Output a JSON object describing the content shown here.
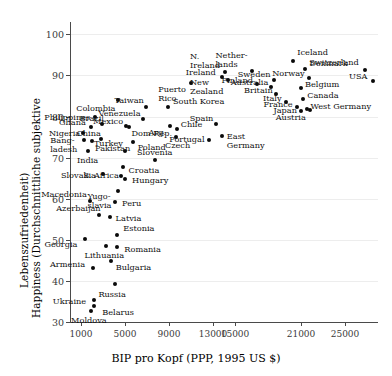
{
  "chart_data": {
    "type": "scatter",
    "title": "",
    "xlabel": "BIP pro Kopf (PPP, 1995 US $)",
    "ylabel_line1": "Happiness (Durchschnittliche subjektive",
    "ylabel_line2": "Lebenszufriedenheit)",
    "xlim": [
      0,
      28000
    ],
    "ylim": [
      30,
      103
    ],
    "grid": "horizontal",
    "legend": "none",
    "xticks": [
      1000,
      5000,
      9000,
      13000,
      15000,
      21000,
      25000
    ],
    "xtick_labels": [
      "1000",
      "5000",
      "9000",
      "13000",
      "15000",
      "21000",
      "25000"
    ],
    "yticks": [
      30,
      40,
      50,
      60,
      70,
      80,
      90,
      100
    ],
    "ytick_labels": [
      "30",
      "40",
      "50",
      "60",
      "70",
      "80",
      "90",
      "100"
    ],
    "points": [
      {
        "name": "Moldova",
        "x": 1900,
        "y": 32.6,
        "lx": -2,
        "ly": 9,
        "a": "c"
      },
      {
        "name": "Ukraine",
        "x": 2200,
        "y": 35.3,
        "lx": -8,
        "ly": 1,
        "a": "r"
      },
      {
        "name": "Belarus",
        "x": 2200,
        "y": 33.9,
        "lx": 8,
        "ly": 6,
        "a": "l"
      },
      {
        "name": "Russia",
        "x": 4100,
        "y": 39.3,
        "lx": -3,
        "ly": 10,
        "a": "c"
      },
      {
        "name": "Armenia",
        "x": 2100,
        "y": 43.1,
        "lx": -8,
        "ly": -4,
        "a": "r"
      },
      {
        "name": "Bulgaria",
        "x": 3700,
        "y": 44.9,
        "lx": 5,
        "ly": 6,
        "a": "l"
      },
      {
        "name": "Lithuania",
        "x": 3300,
        "y": 48.4,
        "lx": -2,
        "ly": 9,
        "a": "c"
      },
      {
        "name": "Georgia",
        "x": 1400,
        "y": 50.2,
        "lx": -8,
        "ly": 5,
        "a": "r"
      },
      {
        "name": "Romania",
        "x": 4300,
        "y": 48.2,
        "lx": 7,
        "ly": 2,
        "a": "l"
      },
      {
        "name": "Estonia",
        "x": 4300,
        "y": 51.1,
        "lx": 6,
        "ly": -7,
        "a": "l"
      },
      {
        "name": "Latvia",
        "x": 3600,
        "y": 55.6,
        "lx": 6,
        "ly": 1,
        "a": "l"
      },
      {
        "name": "Azerbaijan",
        "x": 2600,
        "y": 56.1,
        "lx": 2,
        "ly": -7,
        "a": "r"
      },
      {
        "name": "Peru",
        "x": 4100,
        "y": 59.3,
        "lx": 7,
        "ly": 1,
        "a": "l"
      },
      {
        "name": "Macedonia",
        "x": 1800,
        "y": 59.5,
        "lx": -3,
        "ly": -7,
        "a": "r"
      },
      {
        "name": "Yugo-\nslavia",
        "x": 4400,
        "y": 61.8,
        "lx": -7,
        "ly": 9,
        "a": "r"
      },
      {
        "name": "Slovakia",
        "x": 3000,
        "y": 66.0,
        "lx": -7,
        "ly": 1,
        "a": "r"
      },
      {
        "name": "Hungary",
        "x": 5000,
        "y": 64.8,
        "lx": 7,
        "ly": 1,
        "a": "l"
      },
      {
        "name": "Croatia",
        "x": 4600,
        "y": 65.6,
        "lx": 8,
        "ly": -6,
        "a": "l"
      },
      {
        "name": "S. Africa",
        "x": 4800,
        "y": 67.6,
        "lx": -4,
        "ly": 8,
        "a": "r"
      },
      {
        "name": "Slovenia",
        "x": 7700,
        "y": 69.4,
        "lx": 0,
        "ly": -8,
        "a": "c"
      },
      {
        "name": "Turkey",
        "x": 5000,
        "y": 71.7,
        "lx": -2,
        "ly": -8,
        "a": "r"
      },
      {
        "name": "India",
        "x": 1600,
        "y": 71.6,
        "lx": 0,
        "ly": 9,
        "a": "c"
      },
      {
        "name": "Bang-\nladesh",
        "x": 1300,
        "y": 74.2,
        "lx": -7,
        "ly": 4,
        "a": "r"
      },
      {
        "name": "Pakistan",
        "x": 2000,
        "y": 74.1,
        "lx": 3,
        "ly": 7,
        "a": "l"
      },
      {
        "name": "Poland",
        "x": 5700,
        "y": 73.9,
        "lx": 5,
        "ly": 5,
        "a": "l"
      },
      {
        "name": "Czech",
        "x": 9600,
        "y": 74.9,
        "lx": 2,
        "ly": 8,
        "a": "c"
      },
      {
        "name": "Portugal",
        "x": 12600,
        "y": 74.4,
        "lx": -4,
        "ly": -1,
        "a": "r"
      },
      {
        "name": "East\nGermany",
        "x": 13800,
        "y": 75.2,
        "lx": 5,
        "ly": 4,
        "a": "l"
      },
      {
        "name": "Nigeria",
        "x": 1200,
        "y": 76.1,
        "lx": -3,
        "ly": 0,
        "a": "r"
      },
      {
        "name": "China",
        "x": 2800,
        "y": 74.5,
        "lx": 0,
        "ly": -6,
        "a": "r"
      },
      {
        "name": "Dom.Rep.",
        "x": 5400,
        "y": 77.4,
        "lx": 2,
        "ly": 6,
        "a": "l"
      },
      {
        "name": "Arg.",
        "x": 9100,
        "y": 77.6,
        "lx": -4,
        "ly": 6,
        "a": "r"
      },
      {
        "name": "Chile",
        "x": 9700,
        "y": 76.9,
        "lx": 4,
        "ly": -5,
        "a": "l"
      },
      {
        "name": "Ghana",
        "x": 1900,
        "y": 77.5,
        "lx": -5,
        "ly": -5,
        "a": "r"
      },
      {
        "name": "Mexico",
        "x": 5100,
        "y": 77.6,
        "lx": -3,
        "ly": -5,
        "a": "r"
      },
      {
        "name": "Venezuela",
        "x": 6600,
        "y": 79.4,
        "lx": -2,
        "ly": -6,
        "a": "r"
      },
      {
        "name": "Spain",
        "x": 13300,
        "y": 78.2,
        "lx": -3,
        "ly": -6,
        "a": "r"
      },
      {
        "name": "Brazil",
        "x": 2900,
        "y": 78.1,
        "lx": 2,
        "ly": -6,
        "a": "r"
      },
      {
        "name": "Philippines",
        "x": 2300,
        "y": 79.9,
        "lx": -5,
        "ly": 0,
        "a": "r"
      },
      {
        "name": "Colombia",
        "x": 4400,
        "y": 84.0,
        "lx": -3,
        "ly": 8,
        "a": "r"
      },
      {
        "name": "Taiwan",
        "x": 6900,
        "y": 82.2,
        "lx": -2,
        "ly": -7,
        "a": "r"
      },
      {
        "name": "South Korea",
        "x": 8900,
        "y": 82.2,
        "lx": 5,
        "ly": -6,
        "a": "l"
      },
      {
        "name": "Puerto\nRico",
        "x": 11000,
        "y": 88.1,
        "lx": -5,
        "ly": 10,
        "a": "r"
      },
      {
        "name": "N.\nIreland",
        "x": 14100,
        "y": 90.8,
        "lx": -5,
        "ly": -12,
        "a": "r"
      },
      {
        "name": "Ireland",
        "x": 13800,
        "y": 89.6,
        "lx": -6,
        "ly": -5,
        "a": "r"
      },
      {
        "name": "New\nZealand",
        "x": 14400,
        "y": 88.8,
        "lx": -5,
        "ly": 6,
        "a": "r"
      },
      {
        "name": "Nether-\nlands",
        "x": 16500,
        "y": 91.0,
        "lx": -4,
        "ly": -12,
        "a": "r"
      },
      {
        "name": "Iceland",
        "x": 20300,
        "y": 93.4,
        "lx": 4,
        "ly": -9,
        "a": "l"
      },
      {
        "name": "Denmark",
        "x": 21400,
        "y": 91.5,
        "lx": 4,
        "ly": -6,
        "a": "l"
      },
      {
        "name": "Switzerland",
        "x": 26800,
        "y": 91.3,
        "lx": -6,
        "ly": -8,
        "a": "r"
      },
      {
        "name": "Sweden",
        "x": 18500,
        "y": 89.0,
        "lx": -3,
        "ly": -6,
        "a": "r"
      },
      {
        "name": "Norway",
        "x": 21700,
        "y": 89.4,
        "lx": -4,
        "ly": -5,
        "a": "r"
      },
      {
        "name": "Finland",
        "x": 17000,
        "y": 88.0,
        "lx": -4,
        "ly": -4,
        "a": "r"
      },
      {
        "name": "Australia",
        "x": 18300,
        "y": 87.1,
        "lx": -3,
        "ly": -5,
        "a": "r"
      },
      {
        "name": "Belgium",
        "x": 21000,
        "y": 86.9,
        "lx": 4,
        "ly": -4,
        "a": "l"
      },
      {
        "name": "USA",
        "x": 27500,
        "y": 88.7,
        "lx": -5,
        "ly": -5,
        "a": "r"
      },
      {
        "name": "Britain",
        "x": 18700,
        "y": 85.5,
        "lx": -3,
        "ly": -4,
        "a": "r"
      },
      {
        "name": "Canada",
        "x": 21200,
        "y": 84.3,
        "lx": 4,
        "ly": -4,
        "a": "l"
      },
      {
        "name": "Italy",
        "x": 19600,
        "y": 83.5,
        "lx": -4,
        "ly": -4,
        "a": "r"
      },
      {
        "name": "France",
        "x": 20600,
        "y": 82.3,
        "lx": -4,
        "ly": -3,
        "a": "r"
      },
      {
        "name": "West Germany",
        "x": 21500,
        "y": 81.8,
        "lx": 4,
        "ly": -3,
        "a": "l"
      },
      {
        "name": "Japan",
        "x": 21000,
        "y": 81.3,
        "lx": -4,
        "ly": -1,
        "a": "r"
      },
      {
        "name": "Austria",
        "x": 21800,
        "y": 81.5,
        "lx": -4,
        "ly": 7,
        "a": "r"
      }
    ]
  }
}
